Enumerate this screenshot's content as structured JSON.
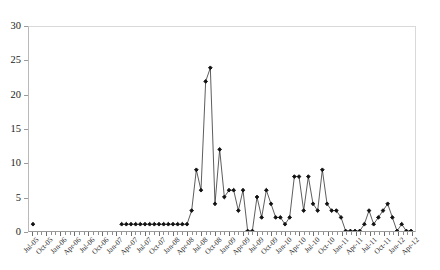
{
  "title_remnant": "",
  "chart_data": {
    "type": "line",
    "title": "",
    "subtitle": "",
    "xlabel": "",
    "ylabel": "",
    "ylim": [
      0,
      30
    ],
    "y_ticks": [
      0,
      5,
      10,
      15,
      20,
      25,
      30
    ],
    "grid": false,
    "legend": null,
    "legend_position": "none",
    "marker": "filled-diamond",
    "line_color": "#333333",
    "marker_color": "#111111",
    "x_tick_interval": "month",
    "x_label_interval": "quarter",
    "x_label_rotation_deg": -45,
    "x_labels": [
      "Jul-05",
      "Oct-05",
      "Jan-06",
      "Apr-06",
      "Jul-06",
      "Oct-06",
      "Jan-07",
      "Apr-07",
      "Jul-07",
      "Oct-07",
      "Jan-08",
      "Apr-08",
      "Jul-08",
      "Oct-08",
      "Jan-09",
      "Apr-09",
      "Jul-09",
      "Oct-09",
      "Jan-10",
      "Apr-10",
      "Jul-10",
      "Oct-10",
      "Jan-11",
      "Apr-11",
      "Jul-11",
      "Oct-11",
      "Jan-12",
      "Apr-12"
    ],
    "x_label_indices": [
      0,
      3,
      6,
      9,
      12,
      15,
      18,
      21,
      24,
      27,
      30,
      33,
      36,
      39,
      42,
      45,
      48,
      51,
      54,
      57,
      60,
      63,
      66,
      69,
      72,
      75,
      78,
      81
    ],
    "n_points": 82,
    "x": [
      "Jul-05",
      "Aug-05",
      "Sep-05",
      "Oct-05",
      "Nov-05",
      "Dec-05",
      "Jan-06",
      "Feb-06",
      "Mar-06",
      "Apr-06",
      "May-06",
      "Jun-06",
      "Jul-06",
      "Aug-06",
      "Sep-06",
      "Oct-06",
      "Nov-06",
      "Dec-06",
      "Jan-07",
      "Feb-07",
      "Mar-07",
      "Apr-07",
      "May-07",
      "Jun-07",
      "Jul-07",
      "Aug-07",
      "Sep-07",
      "Oct-07",
      "Nov-07",
      "Dec-07",
      "Jan-08",
      "Feb-08",
      "Mar-08",
      "Apr-08",
      "May-08",
      "Jun-08",
      "Jul-08",
      "Aug-08",
      "Sep-08",
      "Oct-08",
      "Nov-08",
      "Dec-08",
      "Jan-09",
      "Feb-09",
      "Mar-09",
      "Apr-09",
      "May-09",
      "Jun-09",
      "Jul-09",
      "Aug-09",
      "Sep-09",
      "Oct-09",
      "Nov-09",
      "Dec-09",
      "Jan-10",
      "Feb-10",
      "Mar-10",
      "Apr-10",
      "May-10",
      "Jun-10",
      "Jul-10",
      "Aug-10",
      "Sep-10",
      "Oct-10",
      "Nov-10",
      "Dec-10",
      "Jan-11",
      "Feb-11",
      "Mar-11",
      "Apr-11",
      "May-11",
      "Jun-11",
      "Jul-11",
      "Aug-11",
      "Sep-11",
      "Oct-11",
      "Nov-11",
      "Dec-11",
      "Jan-12",
      "Feb-12",
      "Mar-12",
      "Apr-12"
    ],
    "values": [
      1,
      null,
      null,
      null,
      null,
      null,
      null,
      null,
      null,
      null,
      null,
      null,
      null,
      null,
      null,
      null,
      null,
      null,
      null,
      1,
      1,
      1,
      1,
      1,
      1,
      1,
      1,
      1,
      1,
      1,
      1,
      1,
      1,
      1,
      3,
      9,
      6,
      22,
      24,
      4,
      12,
      5,
      6,
      6,
      3,
      6,
      0,
      0,
      5,
      2,
      6,
      4,
      2,
      2,
      1,
      2,
      8,
      8,
      3,
      8,
      4,
      3,
      9,
      4,
      3,
      3,
      2,
      0,
      0,
      0,
      0,
      1,
      3,
      1,
      2,
      3,
      4,
      2,
      0,
      1,
      0,
      0
    ],
    "segments": [
      {
        "note": "isolated-start-point",
        "from_index": 0,
        "to_index": 0
      },
      {
        "note": "flat-run-at-one",
        "from_index": 19,
        "to_index": 34
      },
      {
        "note": "main-peak-2008",
        "from_index": 35,
        "to_index": 41
      },
      {
        "note": "mid-oscillation",
        "from_index": 42,
        "to_index": 66
      },
      {
        "note": "zero-run-2011",
        "from_index": 67,
        "to_index": 71
      },
      {
        "note": "small-bumps-2011",
        "from_index": 72,
        "to_index": 78
      },
      {
        "note": "trailing-tail",
        "from_index": 79,
        "to_index": 81
      }
    ],
    "max_value": 24,
    "max_at": "Sep-08",
    "min_value": 0
  }
}
